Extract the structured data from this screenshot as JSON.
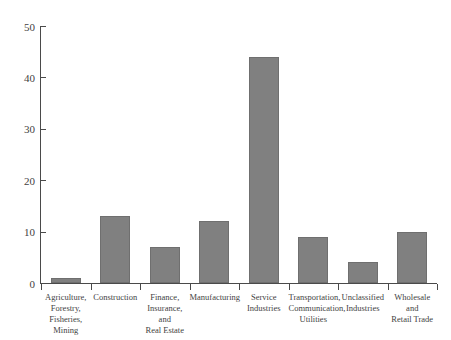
{
  "chart_data": {
    "type": "bar",
    "title": "",
    "subtitle": "",
    "xlabel": "",
    "ylabel": "",
    "ylim": [
      0,
      50
    ],
    "yticks": [
      0,
      10,
      20,
      30,
      40,
      50
    ],
    "ytick_labels": [
      "0",
      "10",
      "20",
      "30",
      "40",
      "50"
    ],
    "grid": false,
    "legend": false,
    "legend_position": "none",
    "orientation": "vertical",
    "bar_color": "#808080",
    "bar_edge_color": "#6f6f6f",
    "axis_color": "#4a4a4a",
    "background_color": "#ffffff",
    "categories": [
      "Agriculture, Forestry, Fisheries, Mining",
      "Construction",
      "Finance, Insurance, and Real Estate",
      "Manufacturing",
      "Service Industries",
      "Transportation, Communication, Utilities",
      "Unclassified Industries",
      "Wholesale and Retail Trade"
    ],
    "category_lines": [
      [
        "Agriculture,",
        "Forestry,",
        "Fisheries, Mining"
      ],
      [
        "Construction"
      ],
      [
        "Finance,",
        "Insurance, and",
        "Real Estate"
      ],
      [
        "Manufacturing"
      ],
      [
        "Service",
        "Industries"
      ],
      [
        "Transportation,",
        "Communication,",
        "Utilities"
      ],
      [
        "Unclassified",
        "Industries"
      ],
      [
        "Wholesale and",
        "Retail Trade"
      ]
    ],
    "values": [
      1,
      13,
      7,
      12,
      44,
      9,
      4,
      10
    ]
  }
}
